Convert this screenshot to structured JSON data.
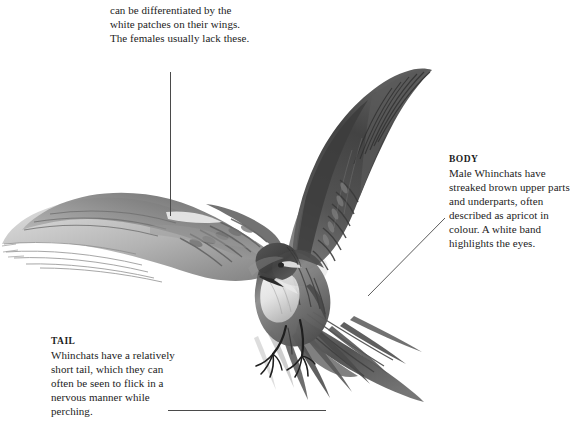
{
  "page": {
    "background_color": "#ffffff",
    "text_color": "#1c1c1c",
    "leader_line_color": "#4a4a4a",
    "width": 574,
    "height": 429
  },
  "illustration": {
    "subject": "Whinchat",
    "description": "Pencil and wash illustration of a male Whinchat in flight, wings spread wide, tail fanned, legs extended with claws open as if about to perch.",
    "palette": {
      "darkest": "#3a3a3a",
      "dark": "#5c5c5c",
      "mid": "#8a8a8a",
      "light": "#b8b8b8",
      "lightest": "#dcdcdc",
      "white_patch": "#f7f7f7"
    }
  },
  "annotations": [
    {
      "id": "wings",
      "heading": "",
      "heading_cut_off": true,
      "heading_trace": "WINGS",
      "text": "Male and female Whinchats can be differentiated by the white patches on their wings. The females usually lack these.",
      "leader": {
        "type": "vertical",
        "x": 170,
        "y1": 72,
        "y2": 216
      }
    },
    {
      "id": "body",
      "heading": "BODY",
      "text": "Male Whinchats have streaked brown upper parts and underparts, often described as apricot in colour. A white band highlights the eyes.",
      "leader": {
        "type": "diagonal",
        "x1": 445,
        "y1": 218,
        "x2": 368,
        "y2": 296
      }
    },
    {
      "id": "tail",
      "heading": "TAIL",
      "text": "Whinchats have a relatively short tail, which they can often be seen to flick in a nervous manner while perching.",
      "leader": {
        "type": "horizontal",
        "y": 410,
        "x1": 168,
        "x2": 326
      }
    }
  ]
}
